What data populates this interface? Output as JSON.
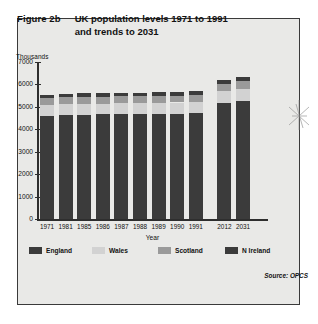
{
  "figure": {
    "number": "Figure 2b",
    "title_line1": "UK population levels 1971 to 1991",
    "title_line2": "and trends to 2031",
    "source": "Source: OPCS"
  },
  "colors": {
    "panel_bg": "#e9e9e7",
    "frame": "#3a3a3a",
    "england": "#3b3b3b",
    "wales": "#d2d2d2",
    "scotland": "#9a9a9a",
    "n_ireland": "#3b3b3b",
    "axis": "#2e2e2e"
  },
  "chart_data": {
    "type": "bar",
    "stacked": true,
    "title": "UK population levels 1971 to 1991 and trends to 2031",
    "xlabel": "Year",
    "ylabel": "Thousands",
    "ylim": [
      0,
      7000
    ],
    "yticks": [
      0,
      1000,
      2000,
      3000,
      4000,
      5000,
      6000,
      7000
    ],
    "ytick_labels": [
      "0",
      "1000",
      "2000",
      "3000",
      "4000",
      "5000",
      "6000",
      "7000"
    ],
    "grid": false,
    "legend_position": "bottom",
    "categories": [
      "1971",
      "1981",
      "1985",
      "1986",
      "1987",
      "1988",
      "1989",
      "1990",
      "1991",
      "2012",
      "2031"
    ],
    "series": [
      {
        "name": "England",
        "color": "#3b3b3b",
        "values": [
          4610,
          4630,
          4650,
          4660,
          4670,
          4680,
          4690,
          4700,
          4720,
          5170,
          5260
        ]
      },
      {
        "name": "Wales",
        "color": "#d2d2d2",
        "values": [
          470,
          480,
          480,
          485,
          485,
          490,
          490,
          495,
          500,
          540,
          545
        ]
      },
      {
        "name": "Scotland",
        "color": "#9a9a9a",
        "values": [
          320,
          315,
          315,
          315,
          312,
          310,
          310,
          308,
          305,
          330,
          330
        ]
      },
      {
        "name": "N Ireland",
        "color": "#3b3b3b",
        "values": [
          150,
          155,
          155,
          158,
          158,
          160,
          160,
          162,
          162,
          170,
          175
        ]
      }
    ],
    "totals": [
      5550,
      5580,
      5600,
      5618,
      5625,
      5640,
      5650,
      5665,
      5687,
      6210,
      6310
    ]
  }
}
